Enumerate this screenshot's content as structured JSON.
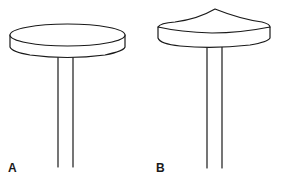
{
  "figure": {
    "panels": [
      {
        "label": "A",
        "shape": "flat-disc"
      },
      {
        "label": "B",
        "shape": "conical-disc"
      }
    ],
    "colors": {
      "line": "#1a1a1a",
      "background": "#ffffff"
    }
  }
}
